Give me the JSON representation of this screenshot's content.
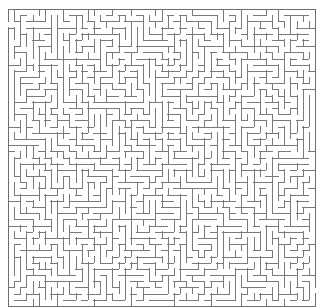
{
  "image": {
    "width": 321,
    "height": 308,
    "background_color": "#ffffff",
    "content_type": "maze",
    "title": "Rectangular perfect maze"
  },
  "maze": {
    "label": "maze-grid",
    "columns": 50,
    "rows": 48,
    "cell_size_px": 6.15,
    "origin_x_px": 8,
    "origin_y_px": 9,
    "width_px": 307,
    "height_px": 297,
    "wall_color": "#7a7a7a",
    "border_color": "#6f6f6f",
    "wall_thickness_px": 1,
    "background_color": "#ffffff",
    "generator": "randomized-depth-first-search",
    "seed": 20240517,
    "perfect": true,
    "entrance": {
      "label": "entrance",
      "side": "left",
      "cell_index": 2
    },
    "exit": {
      "label": "exit",
      "side": "right",
      "cell_index": 45
    },
    "border_sides": [
      "top",
      "right",
      "bottom",
      "left"
    ]
  },
  "margins": {
    "left_px": 8,
    "top_px": 9,
    "right_px": 6,
    "bottom_px": 2
  }
}
